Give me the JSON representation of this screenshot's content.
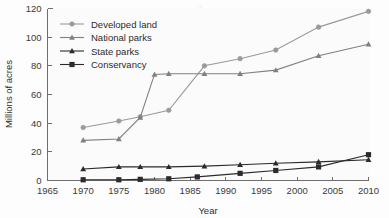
{
  "chart_data": {
    "type": "line",
    "title": "",
    "xlabel": "Year",
    "ylabel": "Millions of acres",
    "xlim": [
      1965,
      2010
    ],
    "ylim": [
      0,
      120
    ],
    "xticks": [
      1965,
      1970,
      1975,
      1980,
      1985,
      1990,
      1995,
      2000,
      2005,
      2010
    ],
    "yticks": [
      0,
      20,
      40,
      60,
      80,
      100,
      120
    ],
    "grid": false,
    "legend_position": "top-left",
    "series": [
      {
        "name": "Developed land",
        "marker": "circle",
        "color": "#9a9a9a",
        "x": [
          1970,
          1975,
          1978,
          1982,
          1987,
          1992,
          1997,
          2003,
          2010
        ],
        "values": [
          37,
          41.5,
          44.5,
          49,
          80,
          85,
          91,
          107,
          118
        ]
      },
      {
        "name": "National parks",
        "marker": "triangle",
        "color": "#808080",
        "x": [
          1970,
          1975,
          1978,
          1980,
          1982,
          1987,
          1992,
          1997,
          2003,
          2010
        ],
        "values": [
          28,
          29,
          44,
          74,
          74.5,
          74.5,
          74.5,
          77,
          87,
          95
        ]
      },
      {
        "name": "State parks",
        "marker": "triangle",
        "color": "#2b2b2b",
        "x": [
          1970,
          1975,
          1978,
          1982,
          1987,
          1992,
          1997,
          2003,
          2010
        ],
        "values": [
          8,
          9.5,
          9.5,
          9.5,
          10,
          11,
          12,
          13,
          14.5
        ]
      },
      {
        "name": "Conservancy",
        "marker": "square",
        "color": "#2b2b2b",
        "x": [
          1970,
          1975,
          1978,
          1982,
          1986,
          1992,
          1997,
          2003,
          2010
        ],
        "values": [
          0.5,
          0.5,
          0.8,
          1.2,
          2.5,
          5,
          7,
          9.5,
          18
        ]
      }
    ]
  },
  "axes": {
    "y_title": "Millions of acres",
    "x_title": "Year",
    "x_tick_labels": [
      "1965",
      "1970",
      "1975",
      "1980",
      "1985",
      "1990",
      "1995",
      "2000",
      "2005",
      "2010"
    ],
    "y_tick_labels": [
      "0",
      "20",
      "40",
      "60",
      "80",
      "100",
      "120"
    ]
  },
  "legend": {
    "entries": [
      {
        "label": "Developed land",
        "marker": "circle-marker",
        "color": "#9a9a9a"
      },
      {
        "label": "National parks",
        "marker": "triangle-marker",
        "color": "#808080"
      },
      {
        "label": "State parks",
        "marker": "triangle-marker",
        "color": "#2b2b2b"
      },
      {
        "label": "Conservancy",
        "marker": "square-marker",
        "color": "#2b2b2b"
      }
    ]
  }
}
